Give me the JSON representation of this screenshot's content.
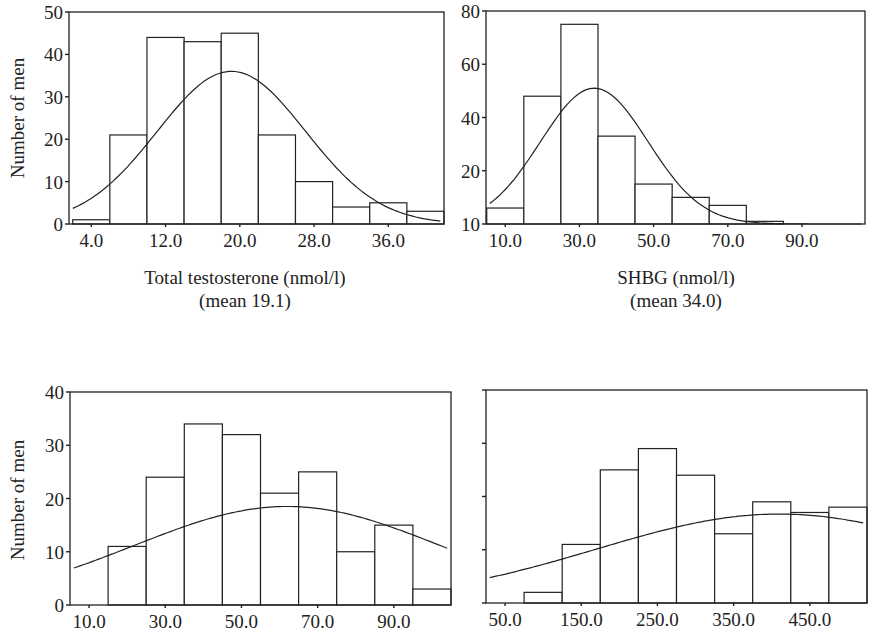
{
  "chart_data": [
    {
      "id": "testosterone",
      "type": "bar",
      "subtype": "histogram_with_normal_curve",
      "title": "",
      "xlabel": "Total testosterone (nmol/l)",
      "xlabel_sub": "(mean 19.1)",
      "ylabel": "Number of men",
      "ylim": [
        0,
        50
      ],
      "y_ticks": [
        "0",
        "10",
        "20",
        "30",
        "40",
        "50"
      ],
      "x_tick_labels": [
        "4.0",
        "12.0",
        "20.0",
        "28.0",
        "36.0"
      ],
      "x_tick_values": [
        4,
        12,
        20,
        28,
        36
      ],
      "bin_width": 4,
      "bin_centers": [
        4,
        8,
        12,
        16,
        20,
        24,
        28,
        32,
        36,
        40
      ],
      "values": [
        1,
        21,
        44,
        43,
        45,
        21,
        10,
        4,
        5,
        3
      ],
      "normal_curve": {
        "mean": 19.1,
        "peak": 36,
        "sd": 8.0
      },
      "xlim": [
        1.6,
        42.0
      ],
      "grid": false
    },
    {
      "id": "shbg",
      "type": "bar",
      "subtype": "histogram_with_normal_curve",
      "title": "",
      "xlabel": "SHBG (nmol/l)",
      "xlabel_sub": "(mean 34.0)",
      "ylabel": "",
      "ylim": [
        0,
        80
      ],
      "y_ticks": [
        "10",
        "20",
        "40",
        "60",
        "80"
      ],
      "y_tick_values": [
        0,
        20,
        40,
        60,
        80
      ],
      "x_tick_labels": [
        "10.0",
        "30.0",
        "50.0",
        "70.0",
        "90.0"
      ],
      "x_tick_values": [
        10,
        30,
        50,
        70,
        90
      ],
      "bin_width": 10,
      "bin_centers": [
        10,
        20,
        30,
        40,
        50,
        60,
        70,
        80,
        90
      ],
      "values": [
        6,
        48,
        75,
        33,
        15,
        10,
        7,
        1,
        0
      ],
      "normal_curve": {
        "mean": 34.0,
        "peak": 51,
        "sd": 14.5
      },
      "xlim": [
        4.8,
        107.0
      ],
      "grid": false
    },
    {
      "id": "bottom-left",
      "type": "bar",
      "subtype": "histogram_with_normal_curve",
      "title": "",
      "xlabel": "",
      "ylabel": "Number of men",
      "ylim": [
        0,
        40
      ],
      "y_ticks": [
        "0",
        "10",
        "20",
        "30",
        "40"
      ],
      "x_tick_labels": [
        "10.0",
        "30.0",
        "50.0",
        "70.0",
        "90.0"
      ],
      "x_tick_values": [
        10,
        30,
        50,
        70,
        90
      ],
      "bin_width": 10,
      "bin_centers": [
        10,
        20,
        30,
        40,
        50,
        60,
        70,
        80,
        90,
        100
      ],
      "values": [
        0,
        11,
        24,
        34,
        32,
        21,
        25,
        10,
        15,
        3
      ],
      "normal_curve": {
        "mean": 62,
        "peak": 18.5,
        "sd": 40
      },
      "xlim": [
        5.0,
        105.0
      ],
      "grid": false
    },
    {
      "id": "bottom-right",
      "type": "bar",
      "subtype": "histogram_with_normal_curve",
      "title": "",
      "xlabel": "",
      "ylabel": "",
      "ylim": [
        0,
        40
      ],
      "y_ticks": [
        "",
        "",
        "",
        "",
        ""
      ],
      "x_tick_labels": [
        "50.0",
        "150.0",
        "250.0",
        "350.0",
        "450.0"
      ],
      "x_tick_values": [
        50,
        150,
        250,
        350,
        450
      ],
      "bin_width": 50,
      "bin_centers": [
        50,
        100,
        150,
        200,
        250,
        300,
        350,
        400,
        450,
        500
      ],
      "values": [
        0,
        2,
        11,
        25,
        29,
        24,
        13,
        19,
        17,
        18
      ],
      "normal_curve": {
        "mean": 410,
        "peak": 16.7,
        "sd": 240
      },
      "xlim": [
        25.0,
        525.0
      ],
      "grid": false
    }
  ],
  "panels": [
    {
      "left": 69,
      "top": 12,
      "right": 444,
      "bottom": 224
    },
    {
      "left": 486,
      "top": 11,
      "right": 865,
      "bottom": 224
    },
    {
      "left": 70,
      "top": 392,
      "right": 451,
      "bottom": 605
    },
    {
      "left": 486,
      "top": 390,
      "right": 867,
      "bottom": 603
    }
  ],
  "labels": {
    "ylabel_top": "Number of men",
    "ylabel_bottom": "Number of men",
    "xlabel_testosterone": "Total testosterone (nmol/l)",
    "xlabel_testosterone_mean": "(mean 19.1)",
    "xlabel_shbg": "SHBG (nmol/l)",
    "xlabel_shbg_mean": "(mean 34.0)"
  }
}
